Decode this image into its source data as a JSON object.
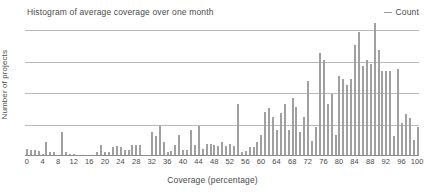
{
  "chart_data": {
    "type": "bar",
    "title": "Histogram of average coverage over one month",
    "xlabel": "Coverage (percentage)",
    "ylabel": "Number of projects",
    "legend": [
      {
        "name": "Count",
        "marker": "line",
        "color": "#9a9a9a"
      }
    ],
    "legend_position": "top-right",
    "grid": true,
    "gridlines": 4,
    "bar_color": "#a0a0a0",
    "xlim": [
      0,
      100
    ],
    "xtick_step": 4,
    "xticks": [
      0,
      4,
      8,
      12,
      16,
      20,
      24,
      28,
      32,
      36,
      40,
      44,
      48,
      52,
      56,
      60,
      64,
      68,
      72,
      76,
      80,
      84,
      88,
      92,
      96,
      100
    ],
    "ylim": [
      0,
      100
    ],
    "yticks": [],
    "ytick_labels": [],
    "categories": [
      0,
      1,
      2,
      3,
      4,
      5,
      6,
      7,
      8,
      9,
      10,
      11,
      12,
      13,
      14,
      15,
      16,
      17,
      18,
      19,
      20,
      21,
      22,
      23,
      24,
      25,
      26,
      27,
      28,
      29,
      30,
      31,
      32,
      33,
      34,
      35,
      36,
      37,
      38,
      39,
      40,
      41,
      42,
      43,
      44,
      45,
      46,
      47,
      48,
      49,
      50,
      51,
      52,
      53,
      54,
      55,
      56,
      57,
      58,
      59,
      60,
      61,
      62,
      63,
      64,
      65,
      66,
      67,
      68,
      69,
      70,
      71,
      72,
      73,
      74,
      75,
      76,
      77,
      78,
      79,
      80,
      81,
      82,
      83,
      84,
      85,
      86,
      87,
      88,
      89,
      90,
      91,
      92,
      93,
      94,
      95,
      96,
      97,
      98,
      99,
      100
    ],
    "values": [
      5,
      4,
      4,
      3,
      1,
      10,
      2,
      2,
      0,
      18,
      2,
      1,
      1,
      0,
      0,
      0,
      0,
      0,
      2,
      8,
      2,
      2,
      6,
      7,
      6,
      4,
      4,
      8,
      8,
      8,
      0,
      0,
      18,
      15,
      23,
      10,
      2,
      3,
      8,
      16,
      4,
      4,
      20,
      8,
      23,
      5,
      9,
      9,
      8,
      7,
      10,
      7,
      9,
      7,
      40,
      2,
      3,
      6,
      6,
      10,
      16,
      34,
      37,
      30,
      20,
      33,
      40,
      20,
      45,
      38,
      18,
      30,
      58,
      11,
      22,
      80,
      75,
      40,
      48,
      16,
      62,
      60,
      55,
      60,
      87,
      97,
      70,
      75,
      72,
      104,
      83,
      66,
      66,
      66,
      15,
      68,
      25,
      32,
      29,
      12,
      22
    ]
  }
}
